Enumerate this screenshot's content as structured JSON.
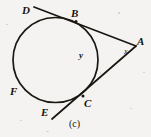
{
  "figure": {
    "caption": "(c)",
    "background_color": "#f4f3f1",
    "ink_color": "#15130f",
    "width": 151,
    "height": 137
  },
  "labels": {
    "point_d": "D",
    "point_b": "B",
    "point_a": "A",
    "point_f": "F",
    "point_e": "E",
    "point_c": "C",
    "angle_x": "x",
    "arc_y": "y"
  },
  "geometry": {
    "circle": {
      "cx": 55.5,
      "cy": 60,
      "r": 42.5
    },
    "tangent_point_b": {
      "x": 76,
      "y": 22
    },
    "tangent_point_c": {
      "x": 83,
      "y": 96
    },
    "external_point_a": {
      "x": 136,
      "y": 46
    },
    "line_dba": {
      "x1": 34,
      "y1": 7,
      "x2": 136,
      "y2": 46
    },
    "line_eca": {
      "x1": 52,
      "y1": 119,
      "x2": 136,
      "y2": 46
    }
  },
  "label_positions": {
    "point_d": {
      "x": 22,
      "y": 5
    },
    "point_b": {
      "x": 71,
      "y": 8
    },
    "point_a": {
      "x": 137,
      "y": 36
    },
    "point_f": {
      "x": 10,
      "y": 86
    },
    "point_e": {
      "x": 41,
      "y": 107
    },
    "point_c": {
      "x": 84,
      "y": 98
    },
    "angle_x": {
      "x": 124,
      "y": 48
    },
    "arc_y": {
      "x": 79,
      "y": 51
    },
    "caption": {
      "x": 69,
      "y": 119
    }
  }
}
